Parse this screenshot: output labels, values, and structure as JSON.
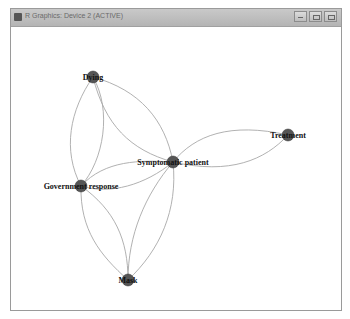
{
  "window": {
    "title": "R Graphics: Device 2 (ACTIVE)",
    "buttons": [
      "minimize",
      "restore",
      "close"
    ]
  },
  "graph": {
    "node_color": "#555555",
    "edge_color": "#a8a8a8",
    "nodes": [
      {
        "id": "dying",
        "label": "Dying",
        "x": 93,
        "y": 77
      },
      {
        "id": "symptomatic",
        "label": "Symptomatic patient",
        "x": 173,
        "y": 162
      },
      {
        "id": "government",
        "label": "Government response",
        "x": 81,
        "y": 186
      },
      {
        "id": "treatment",
        "label": "Treatment",
        "x": 288,
        "y": 135
      },
      {
        "id": "mask",
        "label": "Mask",
        "x": 128,
        "y": 280
      }
    ],
    "edges": [
      [
        "dying",
        "government"
      ],
      [
        "dying",
        "government"
      ],
      [
        "dying",
        "symptomatic"
      ],
      [
        "dying",
        "symptomatic"
      ],
      [
        "government",
        "symptomatic"
      ],
      [
        "government",
        "symptomatic"
      ],
      [
        "symptomatic",
        "treatment"
      ],
      [
        "symptomatic",
        "treatment"
      ],
      [
        "government",
        "mask"
      ],
      [
        "government",
        "mask"
      ],
      [
        "symptomatic",
        "mask"
      ],
      [
        "symptomatic",
        "mask"
      ]
    ]
  }
}
